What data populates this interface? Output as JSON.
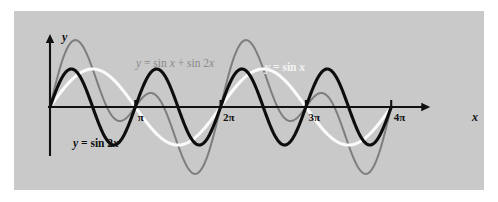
{
  "figure": {
    "background_color": "#ffffff",
    "panel_color": "#c9c9c9"
  },
  "axes": {
    "x_axis_label": "x",
    "y_axis_label": "y",
    "x_ticks": [
      {
        "label": "π",
        "value": 3.141592653589793
      },
      {
        "label": "2π",
        "value": 6.283185307179586
      },
      {
        "label": "3π",
        "value": 9.42477796076938
      },
      {
        "label": "4π",
        "value": 12.566370614359172
      }
    ]
  },
  "curve_labels": {
    "sin2x": {
      "prefix": "y",
      "eq": " = sin 2",
      "var": "x",
      "color": "#0d0d0d"
    },
    "sinx": {
      "prefix": "y",
      "eq": " = sin ",
      "var": "x",
      "color": "#f4f4f4"
    },
    "sum": {
      "prefix": "y",
      "eq": " = sin ",
      "var": "x",
      "eq2": " + sin 2",
      "var2": "x",
      "color": "#8a8a8a"
    }
  },
  "chart_data": {
    "type": "line",
    "title": "",
    "xlabel": "x",
    "ylabel": "y",
    "grid": false,
    "legend_position": "inline-annotations",
    "xlim": [
      0,
      13.194689145077131
    ],
    "ylim": [
      -2,
      2
    ],
    "x_tick_values": [
      3.141592653589793,
      6.283185307179586,
      9.42477796076938,
      12.566370614359172
    ],
    "x_tick_labels": [
      "π",
      "2π",
      "3π",
      "4π"
    ],
    "series": [
      {
        "name": "y = sin 2x",
        "formula": "sin(2*x)",
        "color": "#0d0d0d",
        "linewidth": 3.1,
        "amplitude": 1,
        "period": 3.141592653589793,
        "domain": [
          0,
          12.566370614359172
        ]
      },
      {
        "name": "y = sin x",
        "formula": "sin(x)",
        "color": "#f4f4f4",
        "linewidth": 3.0,
        "amplitude": 1,
        "period": 6.283185307179586,
        "domain": [
          0,
          12.566370614359172
        ]
      },
      {
        "name": "y = sin x + sin 2x",
        "formula": "sin(x) + sin(2*x)",
        "color": "#7e7e7e",
        "linewidth": 2.0,
        "amplitude": 1.7602,
        "period": 6.283185307179586,
        "domain": [
          0,
          12.566370614359172
        ]
      }
    ]
  }
}
